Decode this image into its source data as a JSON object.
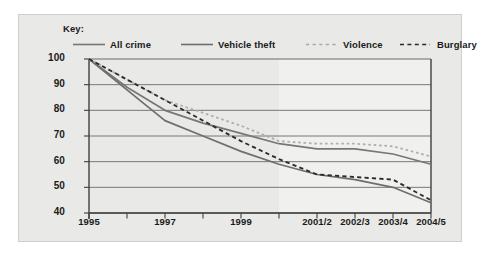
{
  "legend": {
    "title": "Key:",
    "items": [
      {
        "label": "All crime",
        "style": "solid",
        "color": "#777775"
      },
      {
        "label": "Vehicle theft",
        "style": "solid",
        "color": "#6e6e6c"
      },
      {
        "label": "Violence",
        "style": "dotted",
        "color": "#aeaeac"
      },
      {
        "label": "Burglary",
        "style": "dashed",
        "color": "#2b2b2b"
      }
    ]
  },
  "axes": {
    "y_ticks": [
      100,
      90,
      80,
      70,
      60,
      50,
      40
    ],
    "x_ticks": [
      "1995",
      "",
      "1997",
      "",
      "1999",
      "",
      "2001/2",
      "2002/3",
      "2003/4",
      "2004/5"
    ]
  },
  "chart_data": {
    "type": "line",
    "title": "",
    "subtitle": "",
    "xlabel": "",
    "ylabel": "",
    "ylim": [
      40,
      100
    ],
    "grid": true,
    "legend_position": "top",
    "x": [
      "1995",
      "1996",
      "1997",
      "1998",
      "1999",
      "2000",
      "2001/2",
      "2002/3",
      "2003/4",
      "2004/5"
    ],
    "series": [
      {
        "name": "All crime",
        "style": "solid",
        "color": "#777775",
        "values": [
          100,
          89,
          80,
          75,
          71,
          67,
          65,
          65,
          63,
          59
        ]
      },
      {
        "name": "Vehicle theft",
        "style": "solid",
        "color": "#6e6e6c",
        "values": [
          100,
          88,
          76,
          70,
          64,
          59,
          55,
          53,
          50,
          44
        ]
      },
      {
        "name": "Violence",
        "style": "dotted",
        "color": "#aeaeac",
        "values": [
          100,
          92,
          84,
          79,
          74,
          68,
          67,
          67,
          66,
          62
        ]
      },
      {
        "name": "Burglary",
        "style": "dashed",
        "color": "#2b2b2b",
        "values": [
          100,
          92,
          84,
          76,
          68,
          61,
          55,
          54,
          53,
          45
        ]
      }
    ]
  }
}
